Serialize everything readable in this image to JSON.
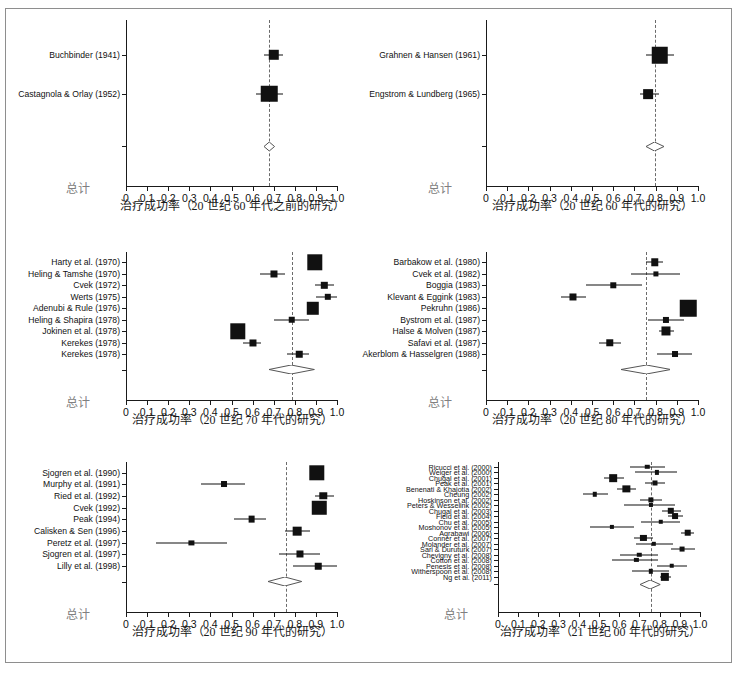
{
  "figure": {
    "width": 737,
    "height": 678,
    "background": "#ffffff",
    "border_color": "#8e8e8e",
    "marker_color": "#111111",
    "refline_color": "#6b6b6b",
    "total_label": "总计",
    "caption": ""
  },
  "axis": {
    "ticks": [
      "0",
      "0.1",
      "0.2",
      "0.3",
      "0.4",
      "0.5",
      "0.6",
      "0.7",
      "0.8",
      "0.9",
      "1.0"
    ],
    "tick_values": [
      0,
      0.1,
      0.2,
      0.3,
      0.4,
      0.5,
      0.6,
      0.7,
      0.8,
      0.9,
      1.0
    ],
    "min": 0,
    "max": 1.0
  },
  "chart_data": {
    "type": "scatter",
    "subtype": "forest-plot",
    "title": "",
    "xlabel_common": "治疗成功率",
    "ylabel": "",
    "xlim": [
      0,
      1.0
    ],
    "grid": false,
    "legend": "none",
    "panels": [
      {
        "id": "pre-1960s",
        "xlabel": "治疗成功率（20 世纪 60 年代之前的研究）",
        "summary_label": "总计",
        "reference_line": 0.68,
        "summary": {
          "estimate": 0.68,
          "lo": 0.655,
          "hi": 0.705
        },
        "studies": [
          {
            "label": "Buchbinder (1941)",
            "estimate": 0.7,
            "lo": 0.655,
            "hi": 0.745,
            "weight": 0.55
          },
          {
            "label": "Castagnola & Orlay (1952)",
            "estimate": 0.68,
            "lo": 0.615,
            "hi": 0.745,
            "weight": 1.0
          }
        ]
      },
      {
        "id": "1960s",
        "xlabel": "治疗成功率（20 世纪 60 年代的研究）",
        "summary_label": "总计",
        "reference_line": 0.795,
        "summary": {
          "estimate": 0.795,
          "lo": 0.755,
          "hi": 0.84
        },
        "studies": [
          {
            "label": "Grahnen & Hansen (1961)",
            "estimate": 0.82,
            "lo": 0.755,
            "hi": 0.885,
            "weight": 1.0
          },
          {
            "label": "Engstrom & Lundberg (1965)",
            "estimate": 0.765,
            "lo": 0.725,
            "hi": 0.815,
            "weight": 0.5
          }
        ]
      },
      {
        "id": "1970s",
        "xlabel": "治疗成功率（20 世纪 70 年代的研究）",
        "summary_label": "总计",
        "reference_line": 0.785,
        "summary": {
          "estimate": 0.785,
          "lo": 0.68,
          "hi": 0.895
        },
        "studies": [
          {
            "label": "Harty et al. (1970)",
            "estimate": 0.895,
            "lo": 0.875,
            "hi": 0.915,
            "weight": 0.92
          },
          {
            "label": "Heling & Tamshe (1970)",
            "estimate": 0.7,
            "lo": 0.635,
            "hi": 0.755,
            "weight": 0.3
          },
          {
            "label": "Cvek (1972)",
            "estimate": 0.94,
            "lo": 0.895,
            "hi": 0.985,
            "weight": 0.25
          },
          {
            "label": "Werts (1975)",
            "estimate": 0.955,
            "lo": 0.9,
            "hi": 1.0,
            "weight": 0.25
          },
          {
            "label": "Adenubi & Rule (1976)",
            "estimate": 0.885,
            "lo": 0.865,
            "hi": 0.91,
            "weight": 0.7
          },
          {
            "label": "Heling & Shapira (1978)",
            "estimate": 0.785,
            "lo": 0.7,
            "hi": 0.865,
            "weight": 0.26
          },
          {
            "label": "Jokinen et al. (1978)",
            "estimate": 0.53,
            "lo": 0.505,
            "hi": 0.56,
            "weight": 0.92
          },
          {
            "label": "Kerekes (1978)",
            "estimate": 0.6,
            "lo": 0.555,
            "hi": 0.64,
            "weight": 0.3
          },
          {
            "label": "Kerekes (1978)",
            "estimate": 0.82,
            "lo": 0.765,
            "hi": 0.865,
            "weight": 0.26
          }
        ]
      },
      {
        "id": "1980s",
        "xlabel": "治疗成功率（20 世纪 80 年代的研究）",
        "summary_label": "总计",
        "reference_line": 0.755,
        "summary": {
          "estimate": 0.755,
          "lo": 0.635,
          "hi": 0.87
        },
        "studies": [
          {
            "label": "Barbakow et al. (1980)",
            "estimate": 0.795,
            "lo": 0.755,
            "hi": 0.835,
            "weight": 0.33
          },
          {
            "label": "Cvek et al. (1982)",
            "estimate": 0.8,
            "lo": 0.685,
            "hi": 0.915,
            "weight": 0.16
          },
          {
            "label": "Boggia (1983)",
            "estimate": 0.6,
            "lo": 0.47,
            "hi": 0.735,
            "weight": 0.18
          },
          {
            "label": "Klevant & Eggink (1983)",
            "estimate": 0.41,
            "lo": 0.355,
            "hi": 0.47,
            "weight": 0.3
          },
          {
            "label": "Pekruhn (1986)",
            "estimate": 0.955,
            "lo": 0.945,
            "hi": 0.97,
            "weight": 1.0
          },
          {
            "label": "Bystrom et al. (1987)",
            "estimate": 0.85,
            "lo": 0.765,
            "hi": 0.935,
            "weight": 0.23
          },
          {
            "label": "Halse & Molven (1987)",
            "estimate": 0.85,
            "lo": 0.815,
            "hi": 0.885,
            "weight": 0.45
          },
          {
            "label": "Safavi et al. (1987)",
            "estimate": 0.585,
            "lo": 0.535,
            "hi": 0.635,
            "weight": 0.33
          },
          {
            "label": "Akerblom & Hasselgren (1988)",
            "estimate": 0.89,
            "lo": 0.805,
            "hi": 0.97,
            "weight": 0.22
          }
        ]
      },
      {
        "id": "1990s",
        "xlabel": "治疗成功率（20 世纪 90 年代的研究）",
        "summary_label": "总计",
        "reference_line": 0.76,
        "summary": {
          "estimate": 0.755,
          "lo": 0.675,
          "hi": 0.835
        },
        "studies": [
          {
            "label": "Sjogren et al. (1990)",
            "estimate": 0.905,
            "lo": 0.885,
            "hi": 0.93,
            "weight": 0.92
          },
          {
            "label": "Murphy et al. (1991)",
            "estimate": 0.465,
            "lo": 0.355,
            "hi": 0.565,
            "weight": 0.22
          },
          {
            "label": "Ried et al. (1992)",
            "estimate": 0.935,
            "lo": 0.895,
            "hi": 0.985,
            "weight": 0.33
          },
          {
            "label": "Cvek (1992)",
            "estimate": 0.915,
            "lo": 0.885,
            "hi": 0.945,
            "weight": 0.85
          },
          {
            "label": "Peak (1994)",
            "estimate": 0.595,
            "lo": 0.51,
            "hi": 0.665,
            "weight": 0.28
          },
          {
            "label": "Calisken & Sen (1996)",
            "estimate": 0.81,
            "lo": 0.755,
            "hi": 0.87,
            "weight": 0.42
          },
          {
            "label": "Peretz et al. (1997)",
            "estimate": 0.31,
            "lo": 0.14,
            "hi": 0.48,
            "weight": 0.16
          },
          {
            "label": "Sjogren et al. (1997)",
            "estimate": 0.825,
            "lo": 0.725,
            "hi": 0.92,
            "weight": 0.3
          },
          {
            "label": "Lilly et al. (1998)",
            "estimate": 0.91,
            "lo": 0.79,
            "hi": 1.0,
            "weight": 0.26
          }
        ]
      },
      {
        "id": "2000s",
        "xlabel": "治疗成功率（21 世纪 00 年代的研究）",
        "summary_label": "总计",
        "reference_line": 0.755,
        "summary": {
          "estimate": 0.755,
          "lo": 0.705,
          "hi": 0.805
        },
        "studies": [
          {
            "label": "Ricucci et al. (2000)",
            "estimate": 0.74,
            "lo": 0.655,
            "hi": 0.825,
            "weight": 0.17
          },
          {
            "label": "Weiger et al. (2000)",
            "estimate": 0.785,
            "lo": 0.68,
            "hi": 0.885,
            "weight": 0.14
          },
          {
            "label": "Chugal et al. (2001)",
            "estimate": 0.57,
            "lo": 0.525,
            "hi": 0.625,
            "weight": 0.55
          },
          {
            "label": "Peak et al. (2001)",
            "estimate": 0.775,
            "lo": 0.73,
            "hi": 0.825,
            "weight": 0.24
          },
          {
            "label": "Benenati & Khajotia (2002)",
            "estimate": 0.635,
            "lo": 0.59,
            "hi": 0.685,
            "weight": 0.5
          },
          {
            "label": "Cheung (2002)",
            "estimate": 0.48,
            "lo": 0.42,
            "hi": 0.545,
            "weight": 0.17
          },
          {
            "label": "Hoskinson et al. (2002)",
            "estimate": 0.755,
            "lo": 0.705,
            "hi": 0.81,
            "weight": 0.26
          },
          {
            "label": "Peters & Wesselink (2002)",
            "estimate": 0.755,
            "lo": 0.625,
            "hi": 0.875,
            "weight": 0.13
          },
          {
            "label": "Chugal et al. (2003)",
            "estimate": 0.855,
            "lo": 0.81,
            "hi": 0.905,
            "weight": 0.4
          },
          {
            "label": "Field et al. (2004)",
            "estimate": 0.875,
            "lo": 0.84,
            "hi": 0.915,
            "weight": 0.34
          },
          {
            "label": "Chu et al. (2005)",
            "estimate": 0.805,
            "lo": 0.71,
            "hi": 0.9,
            "weight": 0.17
          },
          {
            "label": "Moshonov et al. (2005)",
            "estimate": 0.565,
            "lo": 0.455,
            "hi": 0.675,
            "weight": 0.14
          },
          {
            "label": "Aqrabawi (2006)",
            "estimate": 0.94,
            "lo": 0.905,
            "hi": 0.97,
            "weight": 0.42
          },
          {
            "label": "Conner et al. (2007)",
            "estimate": 0.72,
            "lo": 0.675,
            "hi": 0.765,
            "weight": 0.37
          },
          {
            "label": "Molander et al. (2007)",
            "estimate": 0.77,
            "lo": 0.685,
            "hi": 0.865,
            "weight": 0.16
          },
          {
            "label": "Sari & Duruturk (2007)",
            "estimate": 0.91,
            "lo": 0.855,
            "hi": 0.975,
            "weight": 0.22
          },
          {
            "label": "Chevigny et al. (2008)",
            "estimate": 0.7,
            "lo": 0.605,
            "hi": 0.79,
            "weight": 0.17
          },
          {
            "label": "Cotton et al. (2008)",
            "estimate": 0.685,
            "lo": 0.565,
            "hi": 0.79,
            "weight": 0.14
          },
          {
            "label": "Penesis et al. (2008)",
            "estimate": 0.86,
            "lo": 0.785,
            "hi": 0.935,
            "weight": 0.18
          },
          {
            "label": "Witherspoon et al. (2008)",
            "estimate": 0.755,
            "lo": 0.665,
            "hi": 0.845,
            "weight": 0.16
          },
          {
            "label": "Ng et al. (2011)",
            "estimate": 0.825,
            "lo": 0.8,
            "hi": 0.855,
            "weight": 0.62
          }
        ]
      }
    ]
  }
}
